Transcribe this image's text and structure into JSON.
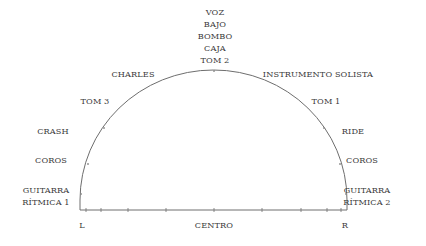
{
  "diagram": {
    "type": "stereo-panning-semicircle",
    "stroke_color": "#6e6e6e",
    "text_color": "#3a3a3a",
    "top_stack": [
      "VOZ",
      "BAJO",
      "BOMBO",
      "CAJA",
      "TOM 2"
    ],
    "left_labels": {
      "charles": "CHARLES",
      "tom3": "TOM 3",
      "crash": "CRASH",
      "coros": "COROS",
      "guitarra_line1": "GUITARRA",
      "guitarra_line2": "RÍTMICA 1"
    },
    "right_labels": {
      "instrumento_solista": "INSTRUMENTO SOLISTA",
      "tom1": "TOM 1",
      "ride": "RIDE",
      "coros": "COROS",
      "guitarra_line1": "GUITARRA",
      "guitarra_line2": "RÍTMICA 2"
    },
    "axis": {
      "left": "L",
      "center": "CENTRO",
      "right": "R"
    }
  }
}
